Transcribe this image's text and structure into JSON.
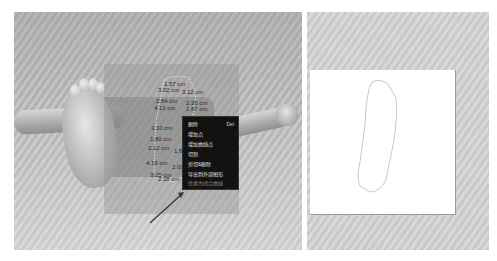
{
  "left_viewport": {
    "title": "3D view",
    "measurements": [
      {
        "label": "1.57 cm",
        "x": 164,
        "y": 81
      },
      {
        "label": "3.02 cm",
        "x": 158,
        "y": 87
      },
      {
        "label": "3.12 cm",
        "x": 182,
        "y": 89
      },
      {
        "label": "2.64 cm",
        "x": 156,
        "y": 98
      },
      {
        "label": "2.35 cm",
        "x": 186,
        "y": 100
      },
      {
        "label": "4.13 cm",
        "x": 154,
        "y": 105
      },
      {
        "label": "1.87 cm",
        "x": 186,
        "y": 106
      },
      {
        "label": "3.10 cm",
        "x": 151,
        "y": 125
      },
      {
        "label": "1.80 cm",
        "x": 150,
        "y": 136
      },
      {
        "label": "2.12 cm",
        "x": 148,
        "y": 145
      },
      {
        "label": "1.8",
        "x": 174,
        "y": 148
      },
      {
        "label": "4.19 cm",
        "x": 146,
        "y": 160
      },
      {
        "label": "2.00",
        "x": 172,
        "y": 164
      },
      {
        "label": "3.25 cm",
        "x": 150,
        "y": 172
      },
      {
        "label": "2.38 cm",
        "x": 158,
        "y": 176
      }
    ]
  },
  "context_menu": {
    "items": [
      {
        "label": "删除",
        "shortcut": "Del",
        "enabled": true
      },
      {
        "label": "增加点",
        "shortcut": "",
        "enabled": true
      },
      {
        "label": "增加曲线点",
        "shortcut": "",
        "enabled": true
      },
      {
        "label": "切割",
        "shortcut": "",
        "enabled": true
      },
      {
        "label": "剪切&删除",
        "shortcut": "",
        "enabled": true
      },
      {
        "label": "导出到外部图形",
        "shortcut": "",
        "enabled": true
      },
      {
        "label": "转换为闭合曲线",
        "shortcut": "",
        "enabled": false
      }
    ]
  },
  "right_viewport": {
    "title": "2D outline view"
  },
  "colors": {
    "menu_bg": "#121212",
    "menu_text": "#e0e0e0",
    "outline_stroke": "#c8c8c8",
    "arrow": "#333333"
  }
}
